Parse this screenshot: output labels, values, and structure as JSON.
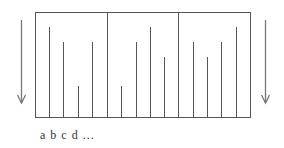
{
  "diagram": {
    "box": {
      "x": 35,
      "y": 12,
      "width": 215,
      "height": 105
    },
    "dividers": [
      107,
      178
    ],
    "baseline_y": 117,
    "sections": [
      {
        "lines": [
          {
            "x": 49,
            "top": 27
          },
          {
            "x": 63,
            "top": 42
          },
          {
            "x": 78,
            "top": 86
          },
          {
            "x": 92,
            "top": 42
          }
        ]
      },
      {
        "lines": [
          {
            "x": 121,
            "top": 86
          },
          {
            "x": 136,
            "top": 42
          },
          {
            "x": 150,
            "top": 27
          },
          {
            "x": 164,
            "top": 57
          }
        ]
      },
      {
        "lines": [
          {
            "x": 193,
            "top": 42
          },
          {
            "x": 207,
            "top": 57
          },
          {
            "x": 221,
            "top": 42
          },
          {
            "x": 236,
            "top": 27
          }
        ]
      }
    ],
    "arrows": [
      {
        "name": "left-down-arrow",
        "x": 21,
        "y1": 20,
        "y2": 103
      },
      {
        "name": "right-down-arrow",
        "x": 265,
        "y1": 20,
        "y2": 103
      }
    ],
    "label_text": "a  b  c  d ...",
    "colors": {
      "stroke": "#555555",
      "arrow": "#777777"
    }
  }
}
